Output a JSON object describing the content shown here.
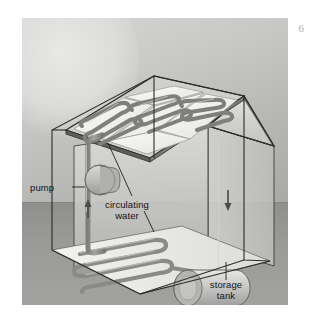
{
  "figure": {
    "style": "grayscale textbook illustration",
    "background": {
      "sky_color": "#c8c8c6",
      "ground_color": "#9a9a98",
      "sun_glow_color": "#e8e8e6"
    },
    "labels": [
      {
        "id": "pump",
        "text": "pump",
        "leader": "horizontal line to pump cylinder"
      },
      {
        "id": "water",
        "line1": "circulating",
        "line2": "water",
        "leader": "two lines to roof collector and floor coil"
      },
      {
        "id": "tank",
        "line1": "storage",
        "line2": "tank",
        "leader": "vertical line to cylindrical tank"
      }
    ],
    "components": {
      "roof_collectors": {
        "panel_count": 3,
        "coil_shape": "serpentine",
        "label": "solar collector panels"
      },
      "floor_coil": {
        "coil_shape": "serpentine",
        "label": "radiant floor coil"
      },
      "pump": {
        "shape": "cylinder",
        "label": "circulation pump"
      },
      "storage_tank": {
        "shape": "horizontal cylinder",
        "label": "storage tank"
      },
      "riser_pipe": {
        "label": "supply riser",
        "flow_arrow": "up"
      },
      "return_pipe": {
        "label": "return downpipe",
        "flow_arrow": "down"
      }
    },
    "colors": {
      "pipe": "#8d8d8b",
      "pipe_dark": "#6f6f6d",
      "panel_face": "#f4f4f2",
      "wall": "#cfcfcd",
      "outline": "#2b2b2b"
    }
  },
  "page": {
    "corner_mark": "6",
    "margin_color": "#ffffff"
  }
}
